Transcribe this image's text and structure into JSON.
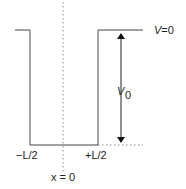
{
  "diagram": {
    "labels": {
      "top_potential": "V=0",
      "depth_symbol": "V",
      "depth_subscript": "0",
      "left_edge": "−L/2",
      "right_edge": "+L/2",
      "center": "x = 0"
    },
    "colors": {
      "line": "#444444",
      "dotted": "#888888"
    }
  }
}
